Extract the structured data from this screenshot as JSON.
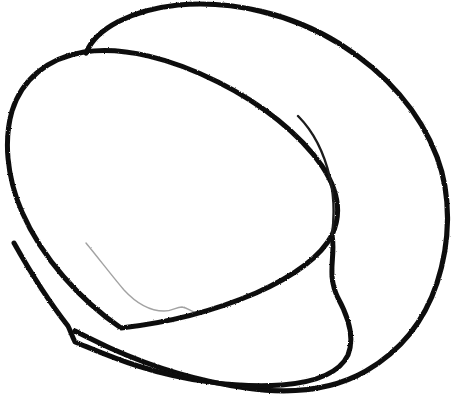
{
  "document": {
    "title": "Hand-drawn ink sketch",
    "kind": "scanned-doodle",
    "width": 452,
    "height": 402,
    "background_color": "#ffffff",
    "ink_color": "#111111"
  },
  "drawing": {
    "description": "Freehand overlapping loops drawn in black ink on white paper, resembling a nested spiral of three large tilted ovals plus a short inner arc and a faint ghost line.",
    "stroke_count": 5,
    "strokes": [
      {
        "id": "stroke-outer-loop",
        "name": "outer-large-loop",
        "color": "#111111",
        "width": 5.2,
        "opacity": 1,
        "path": "M 86 53 C 96 28 132 10 178 5 C 232 0 292 14 340 44 C 386 73 420 112 437 157 C 452 197 450 243 437 283 C 424 322 399 352 366 371 C 331 391 288 394 246 388 C 196 381 150 366 110 348 C 97 342 85 336 75 331"
      },
      {
        "id": "stroke-middle-loop",
        "name": "middle-tilted-oval",
        "color": "#111111",
        "width": 5.0,
        "opacity": 1,
        "path": "M 121 328 C 80 300 42 258 22 212 C 6 175 4 139 12 111 C 22 79 48 58 84 52 C 124 46 172 59 218 82 C 262 104 300 134 322 166 C 338 190 342 214 332 235 C 320 258 292 277 256 293 C 214 311 166 323 121 328 Z"
      },
      {
        "id": "stroke-inner-loop",
        "name": "inner-tilted-oval",
        "color": "#111111",
        "width": 5.0,
        "opacity": 1,
        "path": "M 14 243 C 28 268 46 298 68 326 C 70 330 72 336 75 342 C 90 348 112 358 138 366 C 182 380 234 388 282 385 C 318 382 340 372 348 355 C 354 340 350 320 338 298 C 326 274 336 256 332 235"
      },
      {
        "id": "stroke-inner-arc",
        "name": "short-inner-arc",
        "color": "#1a1a1a",
        "width": 2.4,
        "opacity": 1,
        "path": "M 298 116 C 312 130 324 152 330 178 C 335 200 334 220 332 235"
      },
      {
        "id": "stroke-ghost-line",
        "name": "faint-ghost-line",
        "color": "#555555",
        "width": 1.4,
        "opacity": 0.55,
        "path": "M 86 243 C 100 260 112 276 124 290 C 136 303 150 311 164 311 C 172 311 176 307 182 307 C 188 308 190 311 194 312"
      }
    ]
  }
}
